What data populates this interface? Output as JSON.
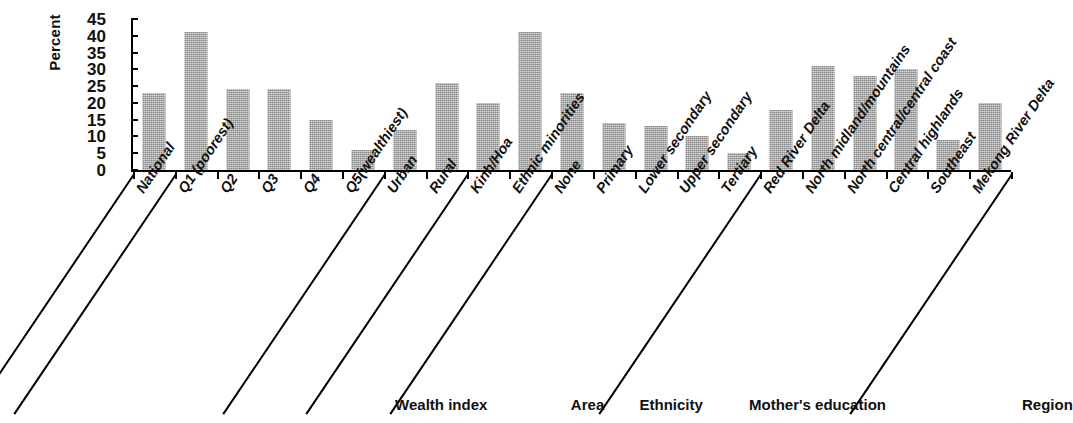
{
  "chart_data": {
    "type": "bar",
    "title": "",
    "xlabel": "",
    "ylabel": "Percent",
    "ylim": [
      0,
      45
    ],
    "yticks": [
      0,
      5,
      10,
      15,
      20,
      25,
      30,
      35,
      40,
      45
    ],
    "grid": false,
    "legend": "none",
    "bar_color": "#a6a6a6",
    "categories": [
      "National",
      "Q1 (poorest)",
      "Q2",
      "Q3",
      "Q4",
      "Q5(wealthiest)",
      "Urban",
      "Rural",
      "Kinh/Hoa",
      "Ethnic minorities",
      "None",
      "Primary",
      "Lower secondary",
      "Upper secondary",
      "Tertiary",
      "Red River Delta",
      "North midland/mountains",
      "North central/central coast",
      "Central highlands",
      "Southeast",
      "Mekong River Delta"
    ],
    "values": [
      23,
      41,
      24,
      24,
      15,
      6,
      12,
      26,
      20,
      41,
      23,
      14,
      13,
      10,
      5,
      18,
      31,
      28,
      30,
      9,
      20
    ],
    "groups": [
      {
        "label": "Wealth index",
        "start": 1,
        "end": 5
      },
      {
        "label": "Area",
        "start": 6,
        "end": 7
      },
      {
        "label": "Ethnicity",
        "start": 8,
        "end": 9
      },
      {
        "label": "Mother's education",
        "start": 10,
        "end": 14
      },
      {
        "label": "Region",
        "start": 15,
        "end": 20
      }
    ]
  }
}
